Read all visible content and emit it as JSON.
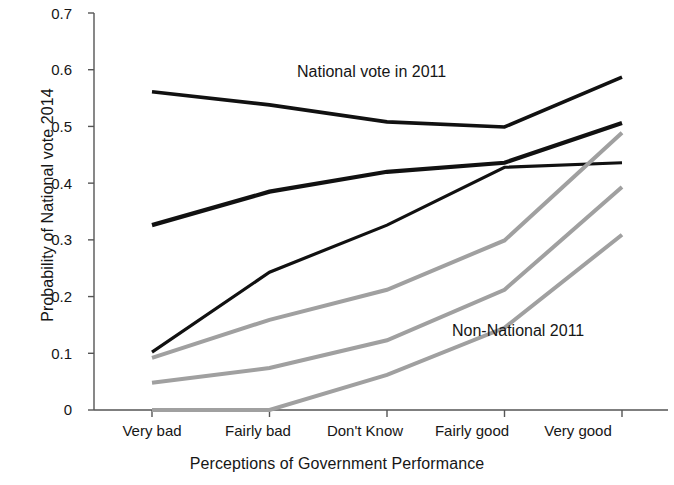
{
  "chart_data": {
    "type": "line",
    "title": "",
    "xlabel": "Perceptions of Government Performance",
    "ylabel": "Probability of National vote 2014",
    "categories": [
      "Very bad",
      "Fairly bad",
      "Don't Know",
      "Fairly good",
      "Very good"
    ],
    "ylim": [
      0,
      0.7
    ],
    "yticks": [
      "0",
      "0.1",
      "0.2",
      "0.3",
      "0.4",
      "0.5",
      "0.6",
      "0.7"
    ],
    "ytick_values": [
      0,
      0.1,
      0.2,
      0.3,
      0.4,
      0.5,
      0.6,
      0.7
    ],
    "grid": false,
    "legend": "annotations-in-plot",
    "annotations": [
      {
        "text": "National vote in 2011",
        "x_category": "Don't Know",
        "y_value": 0.565
      },
      {
        "text": "Non-National 2011",
        "x_category": "Fairly good",
        "y_value": 0.145
      }
    ],
    "series": [
      {
        "name": "National 2011 - line 1",
        "group": "National vote in 2011",
        "color": "#111111",
        "width": 3.6,
        "values": [
          0.561,
          0.538,
          0.508,
          0.499,
          0.587
        ]
      },
      {
        "name": "National 2011 - line 2",
        "group": "National vote in 2011",
        "color": "#111111",
        "width": 4.2,
        "values": [
          0.326,
          0.385,
          0.42,
          0.436,
          0.506
        ]
      },
      {
        "name": "National 2011 - line 3",
        "group": "National vote in 2011",
        "color": "#111111",
        "width": 3.2,
        "values": [
          0.102,
          0.243,
          0.326,
          0.428,
          0.436
        ]
      },
      {
        "name": "Non-National 2011 - line 1",
        "group": "Non-National 2011",
        "color": "#a0a0a0",
        "width": 4.0,
        "values": [
          0.092,
          0.159,
          0.212,
          0.299,
          0.489
        ]
      },
      {
        "name": "Non-National 2011 - line 2",
        "group": "Non-National 2011",
        "color": "#a0a0a0",
        "width": 4.0,
        "values": [
          0.048,
          0.074,
          0.123,
          0.212,
          0.393
        ]
      },
      {
        "name": "Non-National 2011 - line 3",
        "group": "Non-National 2011",
        "color": "#a0a0a0",
        "width": 4.0,
        "values": [
          0.0,
          0.0,
          0.062,
          0.145,
          0.309
        ]
      }
    ],
    "axis_color": "#555555"
  }
}
